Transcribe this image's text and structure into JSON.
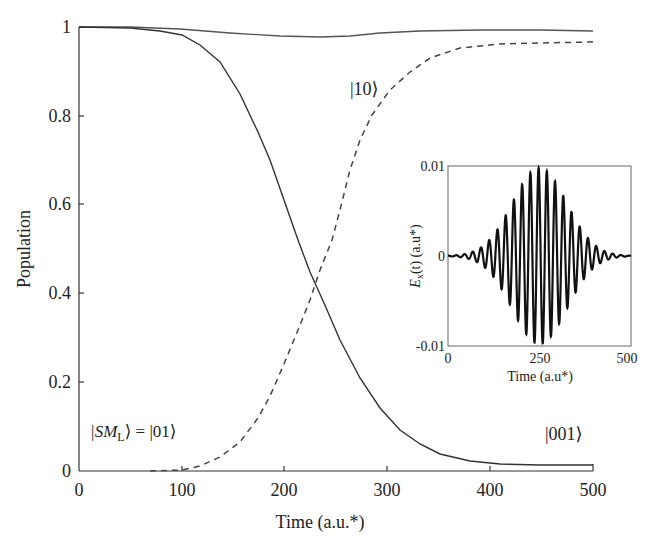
{
  "chart_data": [
    {
      "type": "line",
      "title": "",
      "xlabel": "Time (a.u.*)",
      "ylabel": "Population",
      "xlim": [
        0,
        500
      ],
      "ylim": [
        0,
        1
      ],
      "xticks": [
        "0",
        "100",
        "200",
        "300",
        "400",
        "500"
      ],
      "yticks": [
        "0",
        "0.2",
        "0.4",
        "0.6",
        "0.8",
        "1"
      ],
      "grid": false,
      "x": [
        0,
        50,
        100,
        150,
        200,
        225,
        250,
        275,
        300,
        350,
        400,
        450,
        500
      ],
      "series": [
        {
          "name": "|SM_L⟩ = |01⟩",
          "style": "solid",
          "values": [
            1.0,
            0.998,
            0.99,
            0.93,
            0.75,
            0.62,
            0.5,
            0.4,
            0.3,
            0.14,
            0.05,
            0.02,
            0.015
          ]
        },
        {
          "name": "|10⟩",
          "style": "solid",
          "values": [
            1.0,
            1.0,
            0.995,
            0.985,
            0.978,
            0.975,
            0.972,
            0.972,
            0.977,
            0.985,
            0.987,
            0.987,
            0.987
          ]
        },
        {
          "name": "|001⟩",
          "style": "dashed",
          "values": [
            0.0,
            0.0,
            0.002,
            0.05,
            0.22,
            0.34,
            0.47,
            0.58,
            0.68,
            0.85,
            0.93,
            0.955,
            0.96
          ]
        }
      ],
      "annotations": [
        "|10⟩",
        "|SM_L⟩ = |01⟩",
        "|001⟩"
      ]
    },
    {
      "type": "line",
      "title": "inset",
      "xlabel": "Time (a.u*)",
      "ylabel": "E_x(t) (a.u*)",
      "xlim": [
        0,
        500
      ],
      "ylim": [
        -0.01,
        0.01
      ],
      "xticks": [
        "0",
        "250",
        "500"
      ],
      "yticks": [
        "-0.01",
        "0",
        "0.01"
      ],
      "description": "Gaussian-enveloped oscillating laser pulse, peak amplitude 0.01 at t=250, ~22 oscillation cycles",
      "envelope_center": 250,
      "peak_amplitude": 0.01
    }
  ],
  "main": {
    "xlabel": "Time (a.u.*)",
    "ylabel": "Population",
    "xticks": [
      "0",
      "100",
      "200",
      "300",
      "400",
      "500"
    ],
    "yticks": [
      "0",
      "0.2",
      "0.4",
      "0.6",
      "0.8",
      "1"
    ],
    "label_10": "|10⟩",
    "label_01": "|SM",
    "label_01_sub": "L",
    "label_01_rest": "⟩ = |01⟩",
    "label_001": "|001⟩"
  },
  "inset": {
    "xlabel": "Time (a.u*)",
    "ylabel_e": "E",
    "ylabel_sub": "x",
    "ylabel_rest": "(t) (a.u*)",
    "xticks": [
      "0",
      "250",
      "500"
    ],
    "yticks": [
      "0.01",
      "0",
      "-0.01"
    ]
  }
}
